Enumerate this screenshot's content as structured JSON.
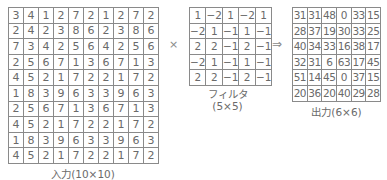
{
  "input": {
    "label": "入力(10×10)",
    "rows": [
      [
        3,
        4,
        1,
        2,
        7,
        2,
        1,
        2,
        7,
        2
      ],
      [
        2,
        4,
        2,
        3,
        8,
        6,
        2,
        3,
        8,
        6
      ],
      [
        7,
        3,
        4,
        2,
        5,
        6,
        4,
        2,
        5,
        6
      ],
      [
        2,
        5,
        6,
        7,
        1,
        3,
        6,
        7,
        1,
        3
      ],
      [
        4,
        5,
        2,
        1,
        7,
        2,
        2,
        1,
        7,
        2
      ],
      [
        1,
        8,
        3,
        9,
        6,
        3,
        3,
        9,
        6,
        3
      ],
      [
        2,
        5,
        6,
        7,
        1,
        3,
        6,
        7,
        1,
        3
      ],
      [
        4,
        5,
        2,
        1,
        7,
        2,
        2,
        1,
        7,
        2
      ],
      [
        1,
        8,
        3,
        9,
        6,
        3,
        3,
        9,
        6,
        3
      ],
      [
        4,
        5,
        2,
        1,
        7,
        2,
        2,
        1,
        7,
        2
      ]
    ]
  },
  "operator_times": "×",
  "filter": {
    "label_line1": "フィルタ",
    "label_line2": "(5×5)",
    "rows": [
      [
        "1",
        "−2",
        "1",
        "−2",
        "1"
      ],
      [
        "−2",
        "1",
        "−1",
        "1",
        "−1"
      ],
      [
        "2",
        "2",
        "−1",
        "2",
        "−1"
      ],
      [
        "−2",
        "1",
        "−1",
        "1",
        "−1"
      ],
      [
        "2",
        "2",
        "−1",
        "2",
        "−1"
      ]
    ]
  },
  "operator_arrow": "⇒",
  "output": {
    "label": "出力(6×6)",
    "rows": [
      [
        31,
        31,
        48,
        0,
        33,
        15
      ],
      [
        28,
        37,
        19,
        30,
        33,
        25
      ],
      [
        40,
        34,
        33,
        16,
        38,
        17
      ],
      [
        32,
        31,
        6,
        63,
        17,
        45
      ],
      [
        51,
        14,
        45,
        0,
        37,
        15
      ],
      [
        20,
        36,
        20,
        40,
        29,
        28
      ]
    ]
  }
}
